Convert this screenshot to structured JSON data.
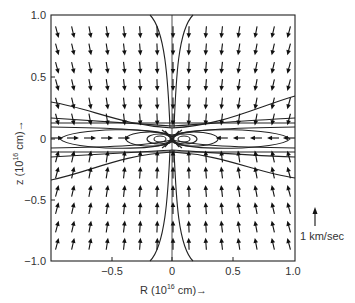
{
  "chart_data": {
    "type": "vector_field",
    "title": "",
    "xlabel": "R (10^16 cm)→",
    "ylabel": "z (10^16 cm)→",
    "xlim": [
      -1.0,
      1.0
    ],
    "ylim": [
      -1.0,
      1.0
    ],
    "x_ticks": [
      {
        "value": -0.5,
        "label": "−0.5"
      },
      {
        "value": 0,
        "label": "0"
      },
      {
        "value": 0.5,
        "label": "0.5"
      },
      {
        "value": 1.0,
        "label": "1.0"
      }
    ],
    "y_ticks": [
      {
        "value": 1.0,
        "label": "1.0"
      },
      {
        "value": 0.5,
        "label": "0.5"
      },
      {
        "value": 0,
        "label": "0"
      },
      {
        "value": -0.5,
        "label": "−0.5"
      },
      {
        "value": -1.0,
        "label": "−1.0"
      }
    ],
    "scale_arrow": {
      "label": "1 km/sec",
      "length_kms": 1
    },
    "grid": false,
    "arrow_grid": {
      "columns_R": [
        -0.95,
        -0.82,
        -0.68,
        -0.54,
        -0.4,
        -0.27,
        -0.13,
        0.0,
        0.13,
        0.27,
        0.4,
        0.54,
        0.68,
        0.82,
        0.95
      ],
      "rows_z": [
        0.86,
        0.72,
        0.57,
        0.43,
        0.28,
        0.15
      ],
      "upper_half_direction": "down, tilted toward R=0",
      "lower_half_direction": "up, tilted toward R=0",
      "midplane_direction": "radially inward"
    }
  },
  "labels": {
    "x_axis": "R (10",
    "x_axis_sup": "16",
    "x_axis_tail": " cm)→",
    "y_axis": "z (10",
    "y_axis_sup": "16",
    "y_axis_tail": " cm)→",
    "scale": "1 km/sec"
  },
  "ticks": {
    "x": [
      "−0.5",
      "0",
      "0.5",
      "1.0"
    ],
    "y": [
      "1.0",
      "0.5",
      "0",
      "−0.5",
      "−1.0"
    ]
  }
}
